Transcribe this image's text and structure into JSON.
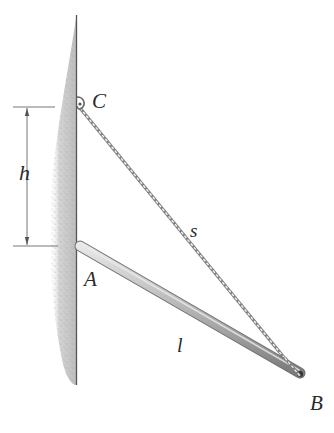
{
  "diagram": {
    "type": "statics-problem-figure",
    "labels": {
      "point_c": "C",
      "point_a": "A",
      "point_b": "B",
      "height": "h",
      "cable_length": "s",
      "rod_length": "l"
    },
    "elements": {
      "wall": {
        "description": "vertical wall with hatched/textured fill",
        "x": 76,
        "y_top": 15,
        "y_bottom": 385
      },
      "rod": {
        "from": "A",
        "to": "B",
        "description": "slender cylindrical rod"
      },
      "cable": {
        "from": "C",
        "to": "B",
        "description": "chain/cable"
      },
      "dimension_h": {
        "from": "C",
        "to": "A",
        "description": "vertical distance between C and A"
      }
    },
    "colors": {
      "wall_fill": "#c8c8c8",
      "wall_line": "#555555",
      "rod": "#a9a9a9",
      "cable": "#8a8a8a",
      "text": "#2a2a2a"
    }
  }
}
